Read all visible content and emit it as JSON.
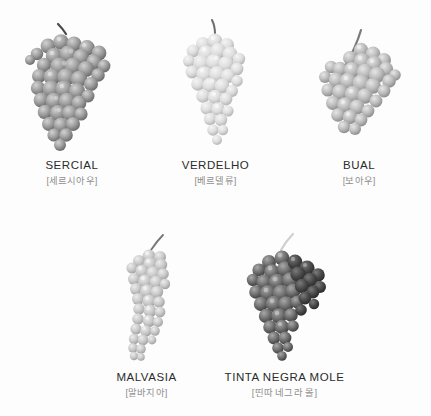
{
  "page": {
    "background_color": "#fdfdfd",
    "name_color": "#2b2b2b",
    "kr_color": "#8e8e8e",
    "layout": "two-row grid of grape variety photographs with captions"
  },
  "rows": [
    {
      "id": "row-top",
      "items": [
        {
          "name": "SERCIAL",
          "kr": "[세르시아우]",
          "art_name": "grape-cluster-sercial",
          "tone": "#9a9a9a",
          "shape": "broad winged cluster, medium-dark grey"
        },
        {
          "name": "VERDELHO",
          "kr": "[베르델류]",
          "art_name": "grape-cluster-verdelho",
          "tone": "#d8d8d8",
          "shape": "slender tapering cluster, very light grey"
        },
        {
          "name": "BUAL",
          "kr": "[보아우]",
          "art_name": "grape-cluster-bual",
          "tone": "#b6b6b6",
          "shape": "rounded compact cluster with long stem, light-mid grey"
        }
      ]
    },
    {
      "id": "row-bottom",
      "items": [
        {
          "name": "MALVASIA",
          "kr": "[말바지아]",
          "art_name": "grape-cluster-malvasia",
          "tone": "#c4c4c4",
          "shape": "long narrow curved cluster, light grey"
        },
        {
          "name": "TINTA NEGRA MOLE",
          "kr": "[띤따 네그라 몰]",
          "art_name": "grape-cluster-tinta-negra-mole",
          "tone": "#6f6f6f",
          "shape": "dense conical cluster, dark grey"
        }
      ]
    }
  ]
}
